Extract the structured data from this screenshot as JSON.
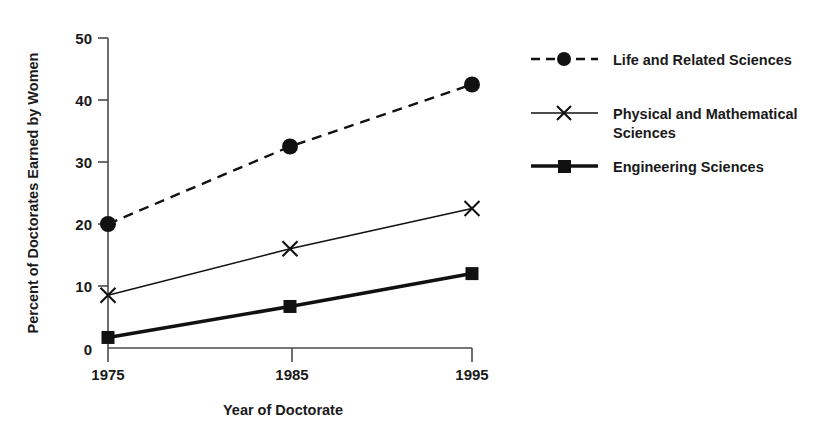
{
  "chart_data": {
    "type": "line",
    "title": "",
    "xlabel": "Year of Doctorate",
    "ylabel": "Percent of Doctorates Earned by Women",
    "categories": [
      "1975",
      "1985",
      "1995"
    ],
    "x": [
      1975,
      1985,
      1995
    ],
    "xlim": [
      1975,
      1995
    ],
    "ylim": [
      0,
      50
    ],
    "yticks": [
      0,
      10,
      20,
      30,
      40,
      50
    ],
    "ytick_labels": [
      "0",
      "10",
      "20",
      "30",
      "40",
      "50"
    ],
    "xticks": [
      1975,
      1985,
      1995
    ],
    "xtick_labels": [
      "1975",
      "1985",
      "1995"
    ],
    "grid": false,
    "legend_position": "right",
    "series": [
      {
        "name": "Life and Related Sciences",
        "values": [
          20.0,
          32.5,
          42.5
        ],
        "marker": "circle",
        "line_style": "dashed",
        "color": "#111111"
      },
      {
        "name": "Physical and Mathematical Sciences",
        "values": [
          8.5,
          16.0,
          22.5
        ],
        "marker": "x",
        "line_style": "solid-thin",
        "color": "#111111"
      },
      {
        "name": "Engineering Sciences",
        "values": [
          1.7,
          6.7,
          12.0
        ],
        "marker": "square",
        "line_style": "solid-thick",
        "color": "#111111"
      }
    ]
  },
  "legend": {
    "entries": [
      {
        "label": "Life and Related Sciences",
        "line2": ""
      },
      {
        "label": "Physical and Mathematical",
        "line2": "Sciences"
      },
      {
        "label": "Engineering Sciences",
        "line2": ""
      }
    ]
  },
  "axes": {
    "y_title": "Percent of Doctorates Earned by Women",
    "x_title": "Year of Doctorate",
    "y_ticks": [
      "50",
      "40",
      "30",
      "20",
      "10",
      "0"
    ],
    "x_ticks": [
      "1975",
      "1985",
      "1995"
    ]
  },
  "colors": {
    "background": "#ffffff",
    "ink": "#111111",
    "axis": "#4a4a4a"
  }
}
